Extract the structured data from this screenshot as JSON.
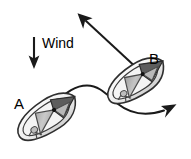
{
  "figure": {
    "background_color": "#ffffff",
    "width": 191,
    "height": 159
  },
  "labels": {
    "wind": "Wind",
    "boat_a": "A",
    "boat_b": "B"
  },
  "colors": {
    "line": "#1a1a1a",
    "hull_fill": "#ffffff",
    "hull_outline": "#2b2b2b",
    "sail_light": "#d8d8d8",
    "sail_mid": "#b0b0b0",
    "sail_dark": "#6e6e6e",
    "bow_dark": "#555555",
    "text": "#000000"
  },
  "elements": {
    "wind_arrow": {
      "name": "wind-direction-arrow",
      "direction": "down",
      "x": 34,
      "y_start": 37,
      "y_end": 69
    },
    "course_arrow": {
      "name": "course-direction-arrow",
      "direction": "up-left",
      "from_x": 139,
      "from_y": 70,
      "to_x": 78,
      "to_y": 13
    },
    "track_path": {
      "name": "boat-track-curve",
      "description": "S-shaped curved track from boat A to lower right arrowhead",
      "start_x": 58,
      "start_y": 98,
      "end_x": 176,
      "end_y": 104
    },
    "boat_a": {
      "name": "sailboat-a",
      "center_x": 48,
      "center_y": 118,
      "heading_degrees": -35
    },
    "boat_b": {
      "name": "sailboat-b",
      "center_x": 137,
      "center_y": 82,
      "heading_degrees": -35
    }
  }
}
